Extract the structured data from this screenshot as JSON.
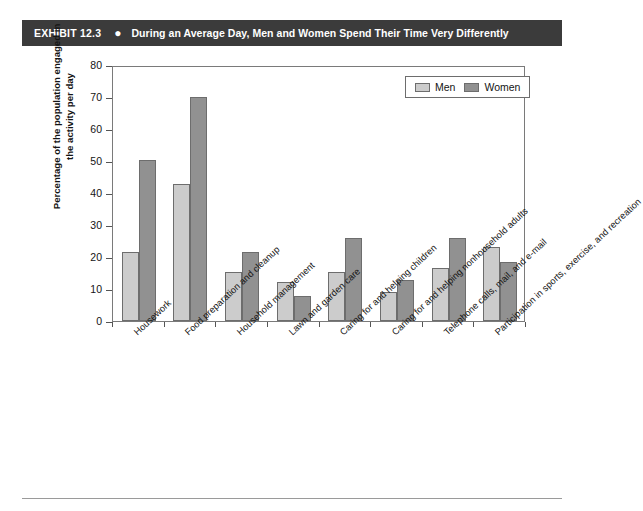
{
  "exhibit": {
    "label": "EXHIBIT 12.3",
    "bullet": "●",
    "title": "During an Average Day, Men and Women Spend Their Time Very Differently",
    "bar_color": "#3b3b3b",
    "text_color": "#ffffff"
  },
  "legend": {
    "position": "top-right",
    "entries": [
      {
        "name": "Men",
        "color": "#cccccc"
      },
      {
        "name": "Women",
        "color": "#919191"
      }
    ]
  },
  "chart_data": {
    "type": "bar",
    "title": "During an Average Day, Men and Women Spend Their Time Very Differently",
    "xlabel": "",
    "ylabel": "Percentage of the population engaged in the activity per day",
    "ylabel_line1": "Percentage of the population engaged in",
    "ylabel_line2": "the activity per day",
    "ylim": [
      0,
      80
    ],
    "yticks": [
      0,
      10,
      20,
      30,
      40,
      50,
      60,
      70,
      80
    ],
    "grid": false,
    "legend_position": "top-right",
    "categories": [
      "Housework",
      "Food preparation and cleanup",
      "Household management",
      "Lawn and garden care",
      "Caring for and helping children",
      "Caring for and helping nonhousehold adults",
      "Telephone calls, mail, and e-mail",
      "Participation in sports, exercise, and recreation"
    ],
    "series": [
      {
        "name": "Men",
        "color": "#cccccc",
        "values": [
          21.5,
          42.7,
          15.4,
          12.2,
          15.3,
          9.1,
          16.5,
          23.2
        ]
      },
      {
        "name": "Women",
        "color": "#919191",
        "values": [
          50.3,
          70.0,
          21.5,
          7.7,
          25.8,
          12.7,
          25.8,
          18.3
        ]
      }
    ]
  }
}
